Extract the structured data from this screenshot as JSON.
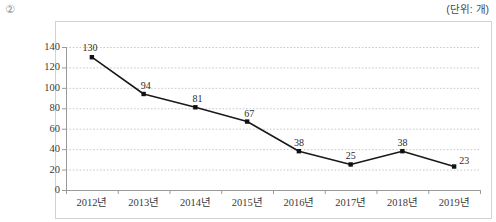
{
  "header": {
    "marker": "②",
    "unit_label": "(단위: 개)"
  },
  "chart_data": {
    "type": "line",
    "title": "",
    "subtitle": "",
    "xlabel": "",
    "ylabel": "",
    "unit": "(단위: 개)",
    "categories": [
      "2012년",
      "2013년",
      "2014년",
      "2015년",
      "2016년",
      "2017년",
      "2018년",
      "2019년"
    ],
    "values": [
      130,
      94,
      81,
      67,
      38,
      25,
      38,
      23
    ],
    "data_labels": [
      "130",
      "94",
      "81",
      "67",
      "38",
      "25",
      "38",
      "23"
    ],
    "ylim": [
      0,
      140
    ],
    "yticks": [
      0,
      20,
      40,
      60,
      80,
      100,
      120,
      140
    ],
    "ytick_labels": [
      "0",
      "20",
      "40",
      "60",
      "80",
      "100",
      "120",
      "140"
    ],
    "grid": true,
    "grid_style": "dotted",
    "legend": false,
    "legend_position": "none",
    "series": [
      {
        "name": "건수",
        "values": [
          130,
          94,
          81,
          67,
          38,
          25,
          38,
          23
        ],
        "color": "#1a1a1a",
        "marker": "square"
      }
    ],
    "colors": {
      "line": "#1a1a1a",
      "marker": "#111111",
      "grid": "#c9c9c9",
      "axis": "#9a9a9a",
      "frame": "#d2d2d2",
      "text": "#2b2b2b"
    }
  }
}
